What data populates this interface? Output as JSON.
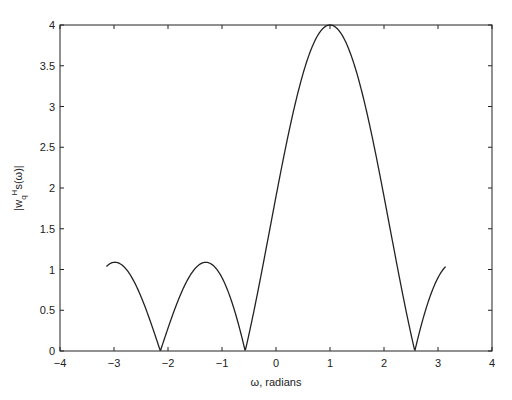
{
  "chart_data": {
    "type": "line",
    "title": "",
    "xlabel": "ω, radians",
    "ylabel": "|w_q^H s(ω)|",
    "xlim": [
      -4,
      4
    ],
    "ylim": [
      0,
      4
    ],
    "xticks": [
      "-4",
      "-3",
      "-2",
      "-1",
      "0",
      "1",
      "2",
      "3",
      "4"
    ],
    "yticks": [
      "0",
      "0.5",
      "1",
      "1.5",
      "2",
      "2.5",
      "3",
      "3.5",
      "4"
    ],
    "grid": false,
    "legend": null,
    "series": [
      {
        "name": "beampattern",
        "description": "|sin(2(ω-1)) / sin((ω-1)/2)|, ω from -π to π",
        "x": [
          -3.14,
          -3.0,
          -2.8,
          -2.6,
          -2.4,
          -2.14,
          -1.9,
          -1.6,
          -1.3,
          -1.0,
          -0.8,
          -0.57,
          -0.3,
          0.0,
          0.3,
          0.6,
          0.8,
          1.0,
          1.2,
          1.4,
          1.7,
          2.0,
          2.3,
          2.57,
          2.8,
          3.0,
          3.14
        ],
        "y": [
          1.05,
          1.09,
          1.02,
          0.76,
          0.4,
          0.0,
          0.49,
          0.95,
          1.09,
          0.74,
          0.39,
          0.0,
          0.92,
          2.02,
          2.94,
          3.57,
          3.85,
          4.0,
          3.85,
          3.57,
          2.73,
          2.02,
          1.06,
          0.0,
          0.56,
          0.93,
          1.05
        ]
      }
    ]
  }
}
